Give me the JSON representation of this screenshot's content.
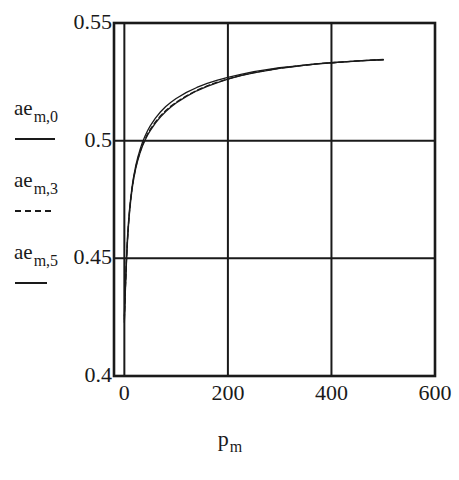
{
  "chart_data": {
    "type": "line",
    "title": "",
    "xlabel": "p_m",
    "xlabel_base": "p",
    "xlabel_sub": "m",
    "ylabel": "ae_m",
    "xlim": [
      -20,
      600
    ],
    "ylim": [
      0.4,
      0.55
    ],
    "xticks": [
      0,
      200,
      400,
      600
    ],
    "xtick_labels": [
      "0",
      "200",
      "400",
      "600"
    ],
    "yticks": [
      0.4,
      0.45,
      0.5,
      0.55
    ],
    "ytick_labels": [
      "0.4",
      "0.45",
      "0.5",
      "0.55"
    ],
    "grid": true,
    "grid_style": "solid-major",
    "legend_position": "left-outside",
    "line_color": "#1a1a1a",
    "frame_color": "#1a1a1a",
    "series": [
      {
        "name": "ae_m,0",
        "label_base": "ae",
        "label_sub": "m,0",
        "style": "solid",
        "x": [
          0,
          2,
          4,
          6,
          8,
          10,
          12,
          15,
          18,
          22,
          26,
          30,
          35,
          40,
          45,
          50,
          60,
          70,
          80,
          90,
          100,
          120,
          140,
          160,
          180,
          200,
          225,
          250,
          275,
          300,
          325,
          350,
          375,
          400,
          425,
          450,
          475,
          500
        ],
        "y": [
          0.4255,
          0.4385,
          0.4498,
          0.4588,
          0.4655,
          0.4708,
          0.4752,
          0.4806,
          0.4848,
          0.4894,
          0.493,
          0.496,
          0.4993,
          0.502,
          0.5043,
          0.5063,
          0.5096,
          0.5123,
          0.5145,
          0.5163,
          0.5179,
          0.5205,
          0.5226,
          0.5243,
          0.5257,
          0.5269,
          0.5282,
          0.5293,
          0.5302,
          0.531,
          0.5316,
          0.5322,
          0.5327,
          0.5331,
          0.5335,
          0.5338,
          0.5341,
          0.5343
        ]
      },
      {
        "name": "ae_m,3",
        "label_base": "ae",
        "label_sub": "m,3",
        "style": "dotted",
        "x": [
          0,
          2,
          4,
          6,
          8,
          10,
          12,
          15,
          18,
          22,
          26,
          30,
          35,
          40,
          45,
          50,
          60,
          70,
          80,
          90,
          100,
          120,
          140,
          160,
          180,
          200,
          225,
          250,
          275,
          300,
          325,
          350,
          375,
          400,
          425,
          450,
          475,
          500
        ],
        "y": [
          0.4241,
          0.4372,
          0.4487,
          0.4578,
          0.4646,
          0.47,
          0.4745,
          0.48,
          0.4842,
          0.4887,
          0.4922,
          0.4951,
          0.4982,
          0.5007,
          0.5029,
          0.5048,
          0.508,
          0.5106,
          0.5128,
          0.5147,
          0.5163,
          0.5191,
          0.5214,
          0.5233,
          0.5249,
          0.5262,
          0.5277,
          0.5289,
          0.5299,
          0.5308,
          0.5315,
          0.5321,
          0.5327,
          0.5331,
          0.5335,
          0.5339,
          0.5342,
          0.5344
        ]
      },
      {
        "name": "ae_m,5",
        "label_base": "ae",
        "label_sub": "m,5",
        "style": "solid",
        "x": [
          0,
          2,
          4,
          6,
          8,
          10,
          12,
          15,
          18,
          22,
          26,
          30,
          35,
          40,
          45,
          50,
          60,
          70,
          80,
          90,
          100,
          120,
          140,
          160,
          180,
          200,
          225,
          250,
          275,
          300,
          325,
          350,
          375,
          400,
          425,
          450,
          475,
          500
        ],
        "y": [
          0.4228,
          0.4362,
          0.4478,
          0.457,
          0.4639,
          0.4694,
          0.4739,
          0.4795,
          0.4837,
          0.4882,
          0.4917,
          0.4946,
          0.4977,
          0.5002,
          0.5024,
          0.5043,
          0.5075,
          0.5101,
          0.5124,
          0.5143,
          0.516,
          0.5188,
          0.5212,
          0.5231,
          0.5247,
          0.5261,
          0.5276,
          0.5288,
          0.5298,
          0.5307,
          0.5314,
          0.5321,
          0.5326,
          0.5331,
          0.5335,
          0.5339,
          0.5342,
          0.5345
        ]
      }
    ]
  },
  "legend": {
    "items": [
      {
        "base": "ae",
        "sub": "m,0",
        "style": "solid"
      },
      {
        "base": "ae",
        "sub": "m,3",
        "style": "dotted"
      },
      {
        "base": "ae",
        "sub": "m,5",
        "style": "solid"
      }
    ]
  },
  "caption_fragment": ""
}
